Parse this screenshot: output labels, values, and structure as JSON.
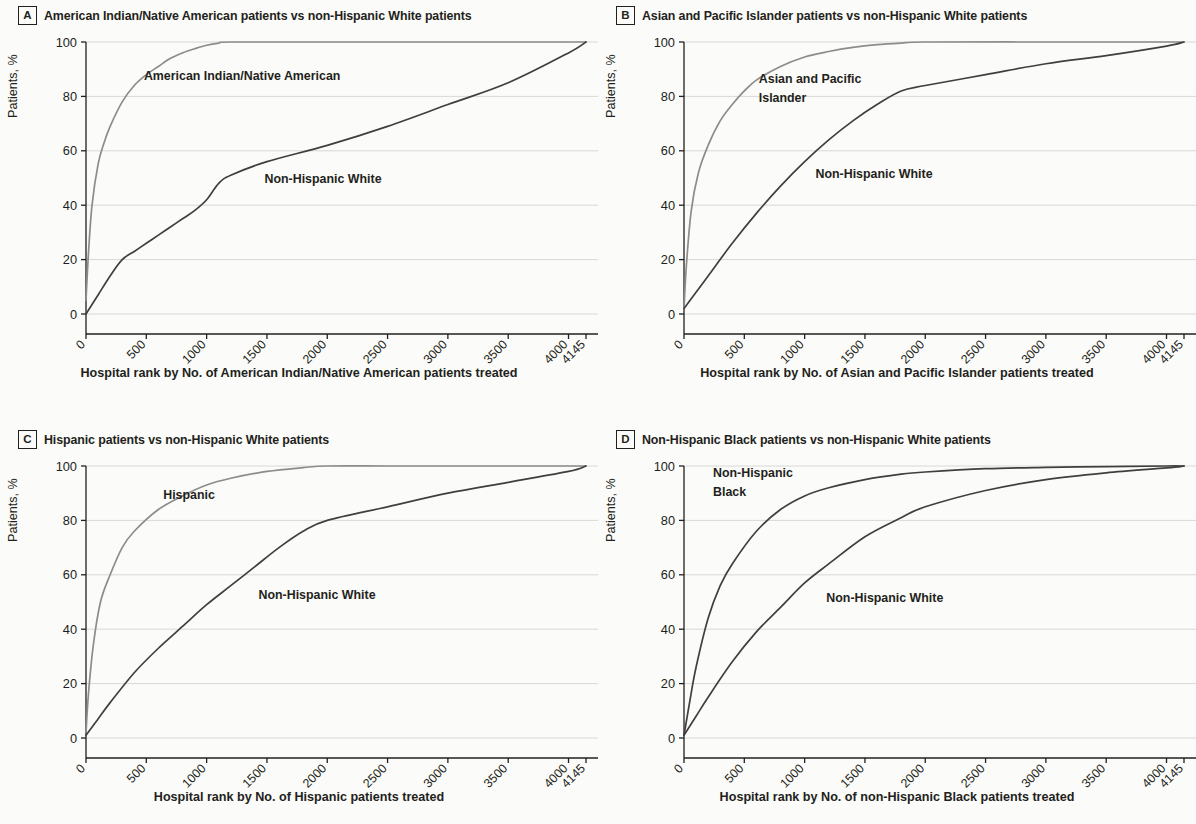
{
  "figure": {
    "axis": {
      "ylabel": "Patients, %",
      "yticks": [
        "0",
        "20",
        "40",
        "60",
        "80",
        "100"
      ],
      "xticks": [
        "0",
        "500",
        "1000",
        "1500",
        "2000",
        "2500",
        "3000",
        "3500",
        "4000",
        "4145"
      ],
      "ylim": [
        0,
        100
      ],
      "xlim": [
        0,
        4145
      ]
    },
    "colors": {
      "minority_curve": "#8c8c8c",
      "white_curve": "#3f3f3f",
      "gridline": "#d8d8d6",
      "axis": "#231f20",
      "background": "#fbfbf9"
    }
  },
  "panels": [
    {
      "letter": "A",
      "title": "American Indian/Native American patients vs non-Hispanic White patients",
      "xlabel": "Hospital rank by No. of American Indian/Native American patients treated",
      "label_minority": "American Indian/Native American",
      "label_white": "Non-Hispanic White"
    },
    {
      "letter": "B",
      "title": "Asian and Pacific Islander patients vs non-Hispanic White patients",
      "xlabel": "Hospital rank by No. of Asian and Pacific Islander patients treated",
      "label_minority": "Asian and Pacific",
      "label_minority2": "Islander",
      "label_white": "Non-Hispanic White"
    },
    {
      "letter": "C",
      "title": "Hispanic patients vs non-Hispanic White patients",
      "xlabel": "Hospital rank by No. of Hispanic patients treated",
      "label_minority": "Hispanic",
      "label_white": "Non-Hispanic White"
    },
    {
      "letter": "D",
      "title": "Non-Hispanic Black patients vs non-Hispanic White patients",
      "xlabel": "Hospital rank by No. of non-Hispanic Black patients treated",
      "label_minority": "Non-Hispanic",
      "label_minority2": "Black",
      "label_white": "Non-Hispanic White"
    }
  ],
  "chart_data": [
    {
      "type": "line",
      "panel": "A",
      "title": "American Indian/Native American patients vs non-Hispanic White patients",
      "xlabel": "Hospital rank by No. of American Indian/Native American patients treated",
      "ylabel": "Patients, %",
      "xlim": [
        0,
        4145
      ],
      "ylim": [
        0,
        100
      ],
      "grid": true,
      "legend": "inline-annotations",
      "series": [
        {
          "name": "American Indian/Native American",
          "color": "#8c8c8c",
          "x": [
            0,
            20,
            50,
            100,
            150,
            200,
            300,
            400,
            500,
            600,
            700,
            800,
            900,
            1000,
            1100,
            1200,
            2000,
            3000,
            4145
          ],
          "y": [
            5,
            22,
            40,
            55,
            63,
            69,
            78,
            84,
            88,
            91,
            94,
            96,
            97.5,
            98.8,
            99.6,
            100,
            100,
            100,
            100
          ]
        },
        {
          "name": "Non-Hispanic White",
          "color": "#3f3f3f",
          "x": [
            0,
            100,
            200,
            300,
            400,
            500,
            600,
            700,
            800,
            900,
            1000,
            1100,
            1200,
            1500,
            2000,
            2500,
            3000,
            3500,
            4000,
            4145
          ],
          "y": [
            0,
            7,
            14,
            20,
            23,
            26,
            29,
            32,
            35,
            38,
            42,
            48,
            51,
            56,
            62,
            69,
            77,
            85,
            96,
            100
          ]
        }
      ]
    },
    {
      "type": "line",
      "panel": "B",
      "title": "Asian and Pacific Islander patients vs non-Hispanic White patients",
      "xlabel": "Hospital rank by No. of Asian and Pacific Islander patients treated",
      "ylabel": "Patients, %",
      "xlim": [
        0,
        4145
      ],
      "ylim": [
        0,
        100
      ],
      "grid": true,
      "legend": "inline-annotations",
      "series": [
        {
          "name": "Asian and Pacific Islander",
          "color": "#8c8c8c",
          "x": [
            0,
            20,
            60,
            120,
            200,
            300,
            400,
            500,
            600,
            800,
            1000,
            1200,
            1400,
            1600,
            1800,
            2000,
            3000,
            4145
          ],
          "y": [
            2,
            18,
            38,
            52,
            62,
            71,
            77,
            82,
            86,
            91,
            94.5,
            96.5,
            98,
            99,
            99.6,
            100,
            100,
            100
          ]
        },
        {
          "name": "Non-Hispanic White",
          "color": "#3f3f3f",
          "x": [
            0,
            100,
            200,
            400,
            600,
            800,
            1000,
            1200,
            1400,
            1600,
            1800,
            2000,
            2500,
            3000,
            3500,
            4000,
            4145
          ],
          "y": [
            2,
            8,
            14,
            26,
            37,
            47,
            56,
            64,
            71,
            77,
            82,
            84,
            88,
            92,
            95,
            98.5,
            100
          ]
        }
      ]
    },
    {
      "type": "line",
      "panel": "C",
      "title": "Hispanic patients vs non-Hispanic White patients",
      "xlabel": "Hospital rank by No. of Hispanic patients treated",
      "ylabel": "Patients, %",
      "xlim": [
        0,
        4145
      ],
      "ylim": [
        0,
        100
      ],
      "grid": true,
      "legend": "inline-annotations",
      "series": [
        {
          "name": "Hispanic",
          "color": "#8c8c8c",
          "x": [
            0,
            20,
            60,
            120,
            200,
            300,
            400,
            600,
            800,
            1000,
            1200,
            1500,
            1800,
            2000,
            2500,
            3000,
            4145
          ],
          "y": [
            2,
            16,
            34,
            50,
            60,
            70,
            76,
            84,
            89,
            93,
            95.5,
            98,
            99.4,
            100,
            100,
            100,
            100
          ]
        },
        {
          "name": "Non-Hispanic White",
          "color": "#3f3f3f",
          "x": [
            0,
            100,
            200,
            400,
            600,
            800,
            1000,
            1200,
            1400,
            1600,
            1800,
            2000,
            2500,
            3000,
            3500,
            4000,
            4145
          ],
          "y": [
            1,
            7,
            13,
            24,
            33,
            41,
            49,
            56,
            63,
            70,
            76,
            80,
            85,
            90,
            94,
            98,
            100
          ]
        }
      ]
    },
    {
      "type": "line",
      "panel": "D",
      "title": "Non-Hispanic Black patients vs non-Hispanic White patients",
      "xlabel": "Hospital rank by No. of non-Hispanic Black patients treated",
      "ylabel": "Patients, %",
      "xlim": [
        0,
        4145
      ],
      "ylim": [
        0,
        100
      ],
      "grid": true,
      "legend": "inline-annotations",
      "series": [
        {
          "name": "Non-Hispanic Black",
          "color": "#3f3f3f",
          "x": [
            0,
            50,
            100,
            200,
            300,
            400,
            600,
            800,
            1000,
            1200,
            1500,
            1800,
            2000,
            2500,
            3000,
            3500,
            4000,
            4145
          ],
          "y": [
            1,
            14,
            26,
            44,
            56,
            64,
            76,
            84,
            89,
            92,
            95,
            97,
            97.8,
            99,
            99.5,
            99.8,
            100,
            100
          ]
        },
        {
          "name": "Non-Hispanic White",
          "color": "#3f3f3f",
          "x": [
            0,
            100,
            200,
            400,
            600,
            800,
            1000,
            1200,
            1500,
            1800,
            2000,
            2500,
            3000,
            3500,
            4000,
            4145
          ],
          "y": [
            1,
            8,
            15,
            28,
            39,
            48,
            57,
            64,
            74,
            81,
            85,
            91,
            95,
            97.5,
            99.3,
            100
          ]
        }
      ]
    }
  ]
}
